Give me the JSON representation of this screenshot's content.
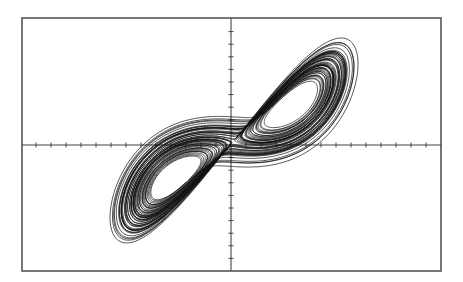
{
  "chart_data": {
    "type": "line",
    "title": "",
    "subtitle": "",
    "xlabel": "",
    "ylabel": "",
    "legend": [],
    "grid": false,
    "axes": {
      "x_axis_through_center": true,
      "y_axis_through_center": true,
      "tick_labels": [],
      "x_ticks_each_side": 13,
      "y_ticks_each_side": 10
    },
    "frame_px": {
      "left": 22,
      "top": 18,
      "right": 441,
      "bottom": 271
    },
    "origin_px": {
      "x": 231,
      "y": 145
    },
    "tick_spacing_px": {
      "x": 15,
      "y": 12.6
    },
    "lobes": [
      {
        "name": "left-lobe",
        "center_px": [
          175,
          175
        ],
        "extent_px": {
          "xmin": 110,
          "xmax": 232,
          "ymin": 120,
          "ymax": 243
        }
      },
      {
        "name": "right-lobe",
        "center_px": [
          285,
          95
        ],
        "extent_px": {
          "xmin": 230,
          "xmax": 358,
          "ymin": 38,
          "ymax": 170
        }
      }
    ],
    "series": [
      {
        "name": "attractor-trajectory",
        "generator": "lorenz",
        "params": {
          "sigma": 10,
          "rho": 28,
          "beta": 2.6667,
          "dt": 0.005,
          "steps": 16000,
          "skip": 500,
          "x0": 0.1,
          "y0": 0.0,
          "z0": 20.0
        },
        "projection": "x-vs-y",
        "color": "#111111",
        "stroke_width": 0.7
      }
    ]
  },
  "colors": {
    "background": "#ffffff",
    "frame": "#555555",
    "axes": "#444444",
    "trajectory": "#111111"
  }
}
